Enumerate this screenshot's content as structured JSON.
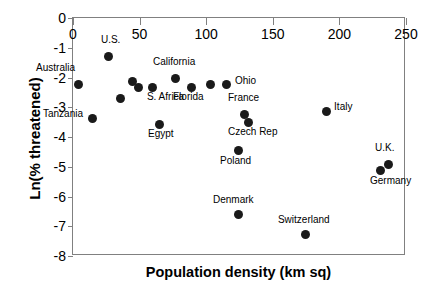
{
  "chart_data": {
    "type": "scatter",
    "title": "",
    "xlabel": "Population density (km sq)",
    "ylabel": "Ln(% threatened)",
    "xlim": [
      0,
      250
    ],
    "ylim": [
      -8,
      0
    ],
    "xticks": [
      0,
      50,
      100,
      150,
      200,
      250
    ],
    "yticks": [
      0,
      -1,
      -2,
      -3,
      -4,
      -5,
      -6,
      -7,
      -8
    ],
    "xtick_labels": [
      "0",
      "50",
      "100",
      "150",
      "200",
      "250"
    ],
    "ytick_labels": [
      "0",
      "-1",
      "-2",
      "-3",
      "-4",
      "-5",
      "-6",
      "-7",
      "-8"
    ],
    "grid": false,
    "legend": null,
    "marker_color": "#1a1a1a",
    "axis_color": "#808080",
    "points": [
      {
        "label": "Australia",
        "x": 3.8,
        "y": -2.22,
        "label_dx": -42,
        "label_dy": -17
      },
      {
        "label": "U.S.",
        "x": 27.0,
        "y": -1.28,
        "label_dx": -8,
        "label_dy": -17
      },
      {
        "label": "",
        "x": 44.3,
        "y": -2.15,
        "label_dx": 0,
        "label_dy": 0
      },
      {
        "label": "S. Africa",
        "x": 49.5,
        "y": -2.32,
        "label_dx": 8,
        "label_dy": 9
      },
      {
        "label": "",
        "x": 60.0,
        "y": -2.32,
        "label_dx": 0,
        "label_dy": 0
      },
      {
        "label": "California",
        "x": 77.3,
        "y": -2.05,
        "label_dx": -23,
        "label_dy": -18
      },
      {
        "label": "Florida",
        "x": 88.6,
        "y": -2.32,
        "label_dx": -18,
        "label_dy": 9
      },
      {
        "label": "",
        "x": 103.6,
        "y": -2.25,
        "label_dx": 0,
        "label_dy": 0
      },
      {
        "label": "Ohio",
        "x": 115.6,
        "y": -2.25,
        "label_dx": 8,
        "label_dy": -5
      },
      {
        "label": "Tanzania",
        "x": 15.0,
        "y": -3.37,
        "label_dx": -50,
        "label_dy": -5
      },
      {
        "label": "",
        "x": 36.0,
        "y": -2.72,
        "label_dx": 0,
        "label_dy": 0
      },
      {
        "label": "Egypt",
        "x": 65.3,
        "y": -3.57,
        "label_dx": -12,
        "label_dy": 9
      },
      {
        "label": "France",
        "x": 128.4,
        "y": -3.23,
        "label_dx": -16,
        "label_dy": -17
      },
      {
        "label": "Czech Rep",
        "x": 131.4,
        "y": -3.5,
        "label_dx": -20,
        "label_dy": 9
      },
      {
        "label": "Italy",
        "x": 190.0,
        "y": -3.13,
        "label_dx": 8,
        "label_dy": -5
      },
      {
        "label": "Poland",
        "x": 123.9,
        "y": -4.47,
        "label_dx": -18,
        "label_dy": 9
      },
      {
        "label": "U.K.",
        "x": 236.5,
        "y": -4.91,
        "label_dx": -13,
        "label_dy": -17
      },
      {
        "label": "Germany",
        "x": 230.5,
        "y": -5.11,
        "label_dx": -10,
        "label_dy": 10
      },
      {
        "label": "Denmark",
        "x": 124.6,
        "y": -6.62,
        "label_dx": -26,
        "label_dy": -16
      },
      {
        "label": "Switzerland",
        "x": 174.9,
        "y": -7.29,
        "label_dx": -28,
        "label_dy": -16
      }
    ]
  },
  "axes": {
    "xlabel": "Population density (km sq)",
    "ylabel": "Ln(% threatened)"
  }
}
